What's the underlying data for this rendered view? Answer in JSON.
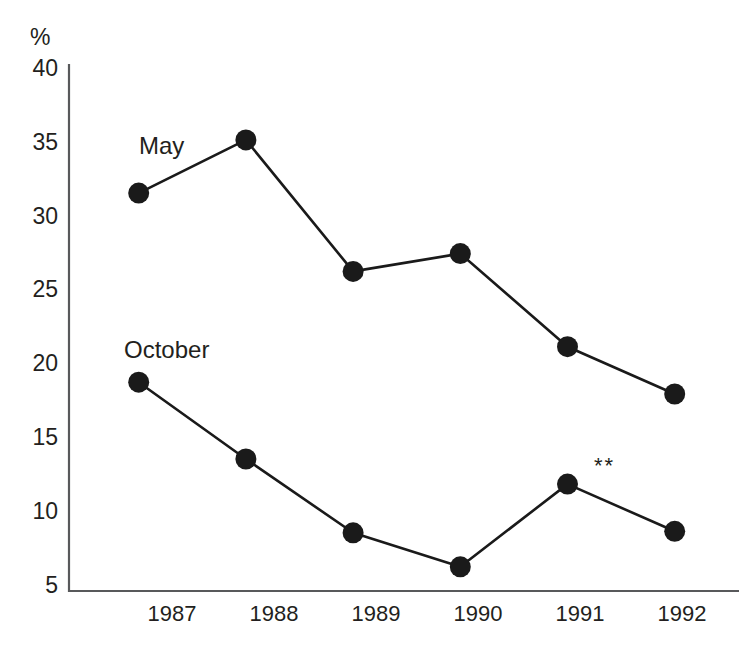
{
  "chart_data": {
    "type": "line",
    "title": "",
    "subtitle": "",
    "xlabel": "",
    "ylabel": "%",
    "categories": [
      "1987",
      "1988",
      "1989",
      "1990",
      "1991",
      "1992"
    ],
    "x": [
      1987,
      1988,
      1989,
      1990,
      1991,
      1992
    ],
    "xlim": [
      1986.35,
      1992.6
    ],
    "ylim": [
      5,
      40
    ],
    "yticks": [
      5,
      10,
      15,
      20,
      25,
      30,
      35,
      40
    ],
    "ytick_labels": [
      "5",
      "10",
      "15",
      "20",
      "25",
      "30",
      "35",
      "40"
    ],
    "grid": false,
    "legend_position": "inline-labels",
    "marker": "filled-circle",
    "marker_color": "#1a1a1a",
    "line_color": "#1a1a1a",
    "axis_color": "#58595b",
    "series": [
      {
        "name": "May",
        "values": [
          31.6,
          35.2,
          26.3,
          27.5,
          21.2,
          18.0
        ]
      },
      {
        "name": "October",
        "values": [
          18.8,
          13.6,
          8.6,
          6.3,
          11.9,
          8.7
        ]
      }
    ],
    "annotations": [
      {
        "text": "**",
        "x": 1991,
        "y": 11.9,
        "series": "October",
        "placement": "above-right"
      }
    ]
  },
  "axis": {
    "unit_label": "%"
  },
  "labels": {
    "may": "May",
    "october": "October",
    "asterisks": "**"
  }
}
